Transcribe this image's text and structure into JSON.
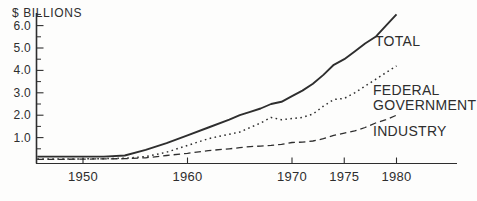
{
  "axis_title": "$ BILLIONS",
  "colors": {
    "line": "#2e2e2e",
    "text": "#2e2e2e",
    "background": "#fdfdfc"
  },
  "series_labels": {
    "total": "TOTAL",
    "federal_line1": "FEDERAL",
    "federal_line2": "GOVERNMENT",
    "industry": "INDUSTRY"
  },
  "chart_data": {
    "type": "line",
    "title": "$ BILLIONS",
    "xlabel": "",
    "ylabel": "$ BILLIONS",
    "xlim": [
      1946,
      1986
    ],
    "ylim": [
      0,
      6.6
    ],
    "grid": false,
    "legend_position": "inline-right-of-lines",
    "x_ticks": [
      1950,
      1960,
      1970,
      1975,
      1980
    ],
    "x_tick_labels": [
      "1950",
      "1960",
      "1970",
      "1975",
      "1980"
    ],
    "y_major_ticks": [
      1,
      2,
      3,
      4,
      5,
      6
    ],
    "y_tick_labels": [
      "1.0",
      "2.0",
      "3.0",
      "4.0",
      "5.0",
      "6.0"
    ],
    "y_minor_ticks": [
      0.5,
      1.5,
      2.5,
      3.5,
      4.5,
      5.5,
      6.5
    ],
    "x": [
      1946,
      1948,
      1950,
      1952,
      1954,
      1956,
      1958,
      1960,
      1962,
      1964,
      1965,
      1966,
      1967,
      1968,
      1969,
      1970,
      1971,
      1972,
      1973,
      1974,
      1975,
      1976,
      1977,
      1978,
      1979,
      1980
    ],
    "series": [
      {
        "name": "TOTAL",
        "style": "solid",
        "values": [
          0.15,
          0.15,
          0.15,
          0.15,
          0.2,
          0.45,
          0.75,
          1.1,
          1.45,
          1.8,
          2.0,
          2.15,
          2.3,
          2.5,
          2.6,
          2.85,
          3.1,
          3.4,
          3.8,
          4.25,
          4.5,
          4.85,
          5.2,
          5.5,
          6.0,
          6.5
        ]
      },
      {
        "name": "FEDERAL GOVERNMENT",
        "style": "dotted",
        "values": [
          0.05,
          0.05,
          0.05,
          0.06,
          0.08,
          0.15,
          0.35,
          0.65,
          0.95,
          1.15,
          1.25,
          1.45,
          1.65,
          1.9,
          1.8,
          1.85,
          1.9,
          2.05,
          2.4,
          2.7,
          2.75,
          3.0,
          3.3,
          3.6,
          3.9,
          4.2
        ]
      },
      {
        "name": "INDUSTRY",
        "style": "dashed",
        "values": [
          0.03,
          0.03,
          0.04,
          0.05,
          0.06,
          0.1,
          0.2,
          0.3,
          0.42,
          0.5,
          0.55,
          0.6,
          0.62,
          0.65,
          0.7,
          0.78,
          0.8,
          0.85,
          0.95,
          1.1,
          1.2,
          1.3,
          1.45,
          1.65,
          1.8,
          2.0
        ]
      }
    ]
  }
}
